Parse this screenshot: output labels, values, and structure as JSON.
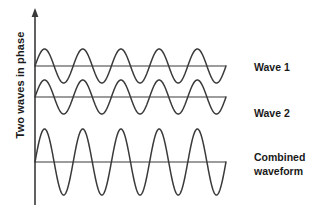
{
  "figure": {
    "title_vertical_axis": "Two waves in phase",
    "background_color": "#ffffff",
    "stroke_color": "#3a3a3a",
    "axis_color": "#3a3a3a",
    "text_color": "#1a1a1a",
    "width": 318,
    "height": 212
  },
  "labels": {
    "wave_1": "Wave 1",
    "wave_2": "Wave 2",
    "combined_line_1": "Combined",
    "combined_line_2": "waveform"
  },
  "chart_data": {
    "type": "line",
    "title": "",
    "subtitle": "",
    "xlabel": "",
    "ylabel": "Two waves in phase",
    "grid": false,
    "legend_position": "right",
    "x_axis": {
      "visible": false,
      "start_px": 35,
      "end_px": 226
    },
    "y_axis": {
      "visible": true,
      "arrow": true,
      "x_px": 35,
      "top_px": 10,
      "bottom_px": 205
    },
    "annotations": [
      {
        "text": "Wave 1",
        "x_px": 254,
        "y_px": 67
      },
      {
        "text": "Wave 2",
        "x_px": 254,
        "y_px": 113
      },
      {
        "text": "Combined waveform",
        "x_px": 254,
        "y_px": 157
      }
    ],
    "series": [
      {
        "name": "Wave 1",
        "waveform": "sine",
        "cycles": 5,
        "amplitude": 1,
        "phase_deg": 0,
        "baseline_px": 66,
        "amplitude_px": 17,
        "x_start_px": 35,
        "x_end_px": 226,
        "zero_line": true
      },
      {
        "name": "Wave 2",
        "waveform": "sine",
        "cycles": 5,
        "amplitude": 1,
        "phase_deg": 0,
        "baseline_px": 97,
        "amplitude_px": 17,
        "x_start_px": 35,
        "x_end_px": 226,
        "zero_line": true
      },
      {
        "name": "Combined waveform",
        "waveform": "sine",
        "cycles": 5,
        "amplitude": 2,
        "phase_deg": 0,
        "baseline_px": 162,
        "amplitude_px": 33,
        "x_start_px": 35,
        "x_end_px": 226,
        "zero_line": true
      }
    ]
  }
}
